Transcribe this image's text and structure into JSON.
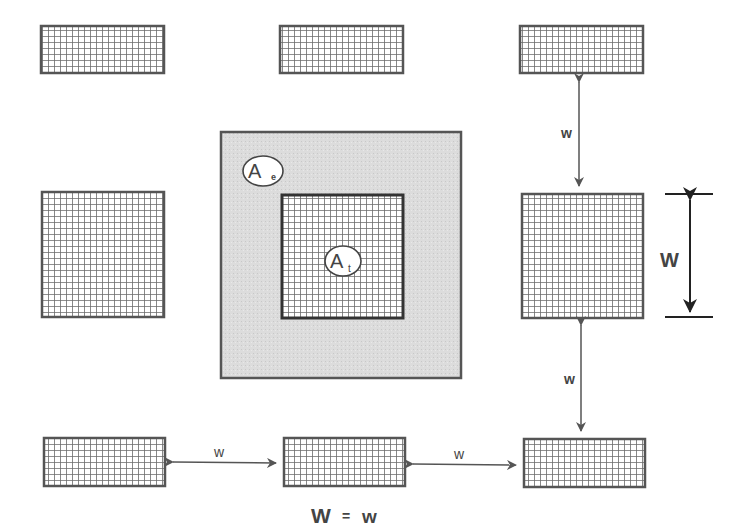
{
  "diagram": {
    "labels": {
      "effective_area": "A",
      "effective_area_sub": "e",
      "tile_area": "A",
      "tile_area_sub": "t",
      "spacing_top_right": "w",
      "spacing_bottom_right": "w",
      "spacing_bottom_left": "w",
      "spacing_bottom_middle": "w",
      "tile_width": "W",
      "equation_left": "W",
      "equation_op": "=",
      "equation_right": "w"
    },
    "colors": {
      "tile_border": "#555555",
      "grid_line": "#6a6a6a",
      "effective_area_fill": "#d9d9d9",
      "effective_area_border": "#555555",
      "arrow": "#555555",
      "background": "#ffffff"
    }
  }
}
